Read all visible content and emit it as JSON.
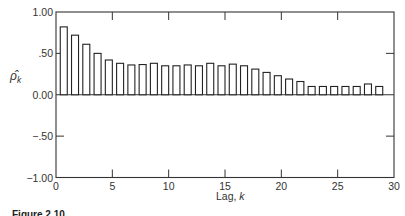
{
  "chart_data": {
    "type": "bar",
    "title": "",
    "xlabel": "Lag, k",
    "ylabel": "ρ̂_k",
    "xlim": [
      0,
      30
    ],
    "ylim": [
      -1.0,
      1.0
    ],
    "x_ticks": [
      0,
      5,
      10,
      15,
      20,
      25,
      30
    ],
    "x_tick_labels": [
      "0",
      "5",
      "10",
      "15",
      "20",
      "25",
      "30"
    ],
    "y_ticks": [
      1.0,
      0.5,
      0.0,
      -0.5,
      -1.0
    ],
    "y_tick_labels": [
      "1.00",
      ".50",
      "0.00",
      "−.50",
      "−1.00"
    ],
    "grid": false,
    "legend": null,
    "x": [
      1,
      2,
      3,
      4,
      5,
      6,
      7,
      8,
      9,
      10,
      11,
      12,
      13,
      14,
      15,
      16,
      17,
      18,
      19,
      20,
      21,
      22,
      23,
      24,
      25,
      26,
      27,
      28,
      29
    ],
    "values": [
      0.82,
      0.72,
      0.61,
      0.5,
      0.42,
      0.38,
      0.36,
      0.365,
      0.38,
      0.35,
      0.35,
      0.36,
      0.35,
      0.38,
      0.35,
      0.37,
      0.35,
      0.31,
      0.27,
      0.23,
      0.19,
      0.16,
      0.1,
      0.1,
      0.1,
      0.1,
      0.1,
      0.13,
      0.1
    ]
  },
  "labels": {
    "ylabel_main": "ρ̂",
    "ylabel_sub": "k",
    "xlabel_main": "Lag, ",
    "xlabel_italic": "k",
    "caption": "Figure 2.10"
  },
  "style": {
    "bar_stroke": "#222222",
    "bar_fill": "#ffffff",
    "axis_color": "#333333"
  }
}
